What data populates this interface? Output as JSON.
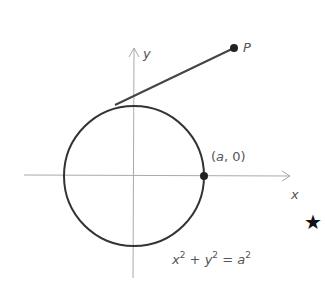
{
  "diagram": {
    "axes": {
      "x_label": "x",
      "y_label": "y",
      "axis_color": "#aaaaaa"
    },
    "circle": {
      "equation_x": "x",
      "equation_y": "y",
      "equation_a": "a",
      "equation_exp": "2",
      "equation_plus": "+",
      "equation_eq": "=",
      "stroke_color": "#333333"
    },
    "points": {
      "P": {
        "label": "P"
      },
      "a0": {
        "label_open": "(",
        "label_a": "a",
        "label_rest": ", 0)"
      }
    },
    "tangent_line": {
      "color": "#444444"
    },
    "marker": {
      "symbol": "★"
    }
  }
}
